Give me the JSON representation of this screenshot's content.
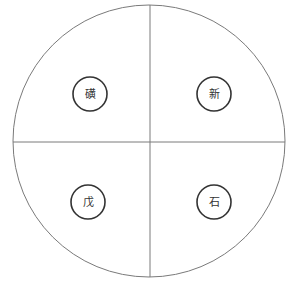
{
  "diagram": {
    "type": "quadrant-circle",
    "outer_circle": {
      "cx": 149,
      "cy": 141,
      "r": 136,
      "stroke": "#7a7a7a"
    },
    "divider_color": "#7a7a7a",
    "node_stroke": "#333333",
    "quadrants": [
      {
        "position": "top-left",
        "label": "磺",
        "cx": 90,
        "cy": 94
      },
      {
        "position": "top-right",
        "label": "新",
        "cx": 214,
        "cy": 94
      },
      {
        "position": "bottom-left",
        "label": "戊",
        "cx": 88,
        "cy": 202
      },
      {
        "position": "bottom-right",
        "label": "石",
        "cx": 214,
        "cy": 202
      }
    ]
  }
}
